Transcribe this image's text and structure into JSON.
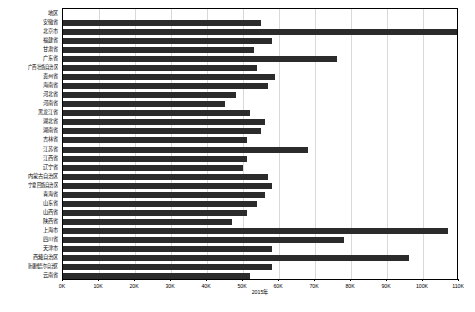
{
  "chart": {
    "category_header": "地区",
    "axis_title": "2015年"
  },
  "chart_data": {
    "type": "bar",
    "orientation": "horizontal",
    "title": "",
    "subtitle": "",
    "xlabel": "2015年",
    "ylabel": "地区",
    "xlim": [
      0,
      110000
    ],
    "grid": true,
    "legend": "none",
    "tick_labels": [
      "0K",
      "10K",
      "20K",
      "30K",
      "40K",
      "50K",
      "60K",
      "70K",
      "80K",
      "90K",
      "100K",
      "110K"
    ],
    "tick_values": [
      0,
      10000,
      20000,
      30000,
      40000,
      50000,
      60000,
      70000,
      80000,
      90000,
      100000,
      110000
    ],
    "bar_color": "#2b2b2b",
    "categories": [
      "安徽省",
      "北京市",
      "福建省",
      "甘肃省",
      "广东省",
      "广西壮族自治区",
      "贵州省",
      "海南省",
      "河北省",
      "河南省",
      "黑龙江省",
      "湖北省",
      "湖南省",
      "吉林省",
      "江苏省",
      "江西省",
      "辽宁省",
      "内蒙古自治区",
      "宁夏回族自治区",
      "青海省",
      "山东省",
      "山西省",
      "陕西省",
      "上海市",
      "四川省",
      "天津市",
      "西藏自治区",
      "新疆维吾尔自治区",
      "云南省"
    ],
    "values": [
      55000,
      110000,
      58000,
      53000,
      76000,
      54000,
      59000,
      57000,
      48000,
      45000,
      52000,
      56000,
      55000,
      51000,
      68000,
      51000,
      50000,
      57000,
      58000,
      56000,
      54000,
      51000,
      47000,
      107000,
      78000,
      58000,
      96000,
      58000,
      52000
    ]
  }
}
